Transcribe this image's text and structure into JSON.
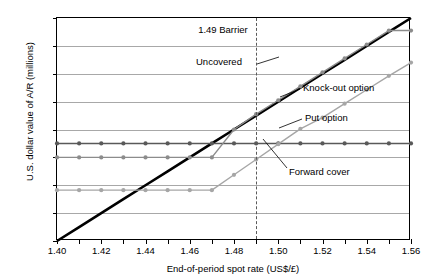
{
  "chart_data": {
    "type": "line",
    "title": "",
    "xlabel": "End-of-period spot rate (US$/£)",
    "ylabel": "U.S. dollar value of A/R (millions)",
    "xlim": [
      1.4,
      1.56
    ],
    "ylim": [
      1.4,
      1.56
    ],
    "grid": true,
    "legend_position": "inline-annotations",
    "xticks": [
      1.4,
      1.41,
      1.42,
      1.43,
      1.44,
      1.45,
      1.46,
      1.47,
      1.48,
      1.49,
      1.5,
      1.51,
      1.52,
      1.53,
      1.54,
      1.55,
      1.56
    ],
    "xtick_labels": [
      "1.40",
      "",
      "1.42",
      "",
      "1.44",
      "",
      "1.46",
      "",
      "1.48",
      "",
      "1.50",
      "",
      "1.52",
      "",
      "1.54",
      "",
      "1.56"
    ],
    "yticks": [
      1.4,
      1.42,
      1.44,
      1.46,
      1.48,
      1.5,
      1.52,
      1.54,
      1.56
    ],
    "ytick_labels": [
      "1.40",
      "1.42",
      "1.44",
      "1.46",
      "1.48",
      "1.50",
      "1.52",
      "1.54",
      "1.56"
    ],
    "x": [
      1.4,
      1.41,
      1.42,
      1.43,
      1.44,
      1.45,
      1.46,
      1.47,
      1.48,
      1.49,
      1.5,
      1.51,
      1.52,
      1.53,
      1.54,
      1.55,
      1.56
    ],
    "series": [
      {
        "name": "Uncovered",
        "color": "#000000",
        "width": 2.6,
        "markers": false,
        "values": [
          1.4,
          1.41,
          1.42,
          1.43,
          1.44,
          1.45,
          1.46,
          1.47,
          1.48,
          1.49,
          1.5,
          1.51,
          1.52,
          1.53,
          1.54,
          1.55,
          1.56
        ]
      },
      {
        "name": "Forward cover",
        "color": "#595959",
        "width": 1.4,
        "markers": true,
        "values": [
          1.47,
          1.47,
          1.47,
          1.47,
          1.47,
          1.47,
          1.47,
          1.47,
          1.47,
          1.47,
          1.47,
          1.47,
          1.47,
          1.47,
          1.47,
          1.47,
          1.47
        ]
      },
      {
        "name": "Knock-out option",
        "color": "#8c8c8c",
        "width": 1.4,
        "markers": true,
        "values": [
          1.46,
          1.46,
          1.46,
          1.46,
          1.46,
          1.46,
          1.46,
          1.46,
          1.48,
          1.491,
          1.501,
          1.511,
          1.521,
          1.531,
          1.541,
          1.551,
          1.551
        ]
      },
      {
        "name": "Put option",
        "color": "#a6a6a6",
        "width": 1.4,
        "markers": true,
        "values": [
          1.4365,
          1.4365,
          1.4365,
          1.4365,
          1.4365,
          1.4365,
          1.4365,
          1.4365,
          1.4475,
          1.4585,
          1.4695,
          1.4805,
          1.4885,
          1.4985,
          1.5085,
          1.5185,
          1.528
        ]
      }
    ],
    "annotations": [
      {
        "name": "barrier",
        "text": "1.49 Barrier",
        "x": 1.49,
        "kind": "vline-dashed"
      },
      {
        "name": "uncovered",
        "text": "Uncovered",
        "kind": "leader"
      },
      {
        "name": "knock-out-option",
        "text": "Knock-out option",
        "kind": "leader"
      },
      {
        "name": "put-option",
        "text": "Put option",
        "kind": "leader"
      },
      {
        "name": "forward-cover",
        "text": "Forward cover",
        "kind": "leader"
      }
    ]
  }
}
